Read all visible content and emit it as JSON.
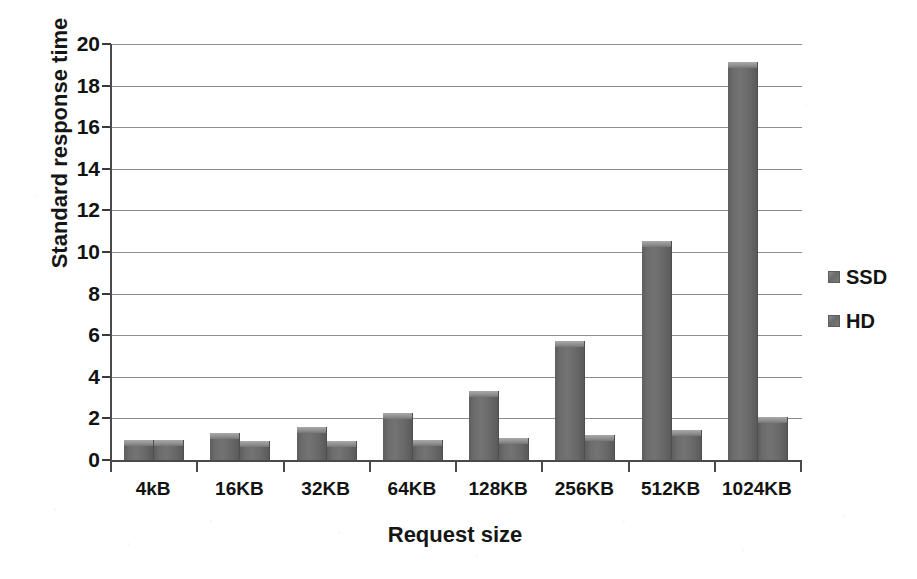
{
  "chart_data": {
    "type": "bar",
    "title": "",
    "xlabel": "Request size",
    "ylabel": "Standard response time",
    "categories": [
      "4kB",
      "16KB",
      "32KB",
      "64KB",
      "128KB",
      "256KB",
      "512KB",
      "1024KB"
    ],
    "series": [
      {
        "name": "SSD",
        "values": [
          0.95,
          1.3,
          1.6,
          2.25,
          3.3,
          5.7,
          10.55,
          19.15
        ]
      },
      {
        "name": "HD",
        "values": [
          0.95,
          0.9,
          0.9,
          0.95,
          1.05,
          1.2,
          1.45,
          2.05
        ]
      }
    ],
    "ylim": [
      0,
      20
    ],
    "ytick_values": [
      0,
      2,
      4,
      6,
      8,
      10,
      12,
      14,
      16,
      18,
      20
    ],
    "ytick_labels": [
      "0",
      "2",
      "4",
      "6",
      "8",
      "10",
      "12",
      "14",
      "16",
      "18",
      "20"
    ],
    "grid": true,
    "legend_position": "right",
    "bar_color": "#6c6c6c",
    "gridline_color": "#8c8c8c",
    "axis_color": "#4a4a4a",
    "background": "#ffffff"
  }
}
